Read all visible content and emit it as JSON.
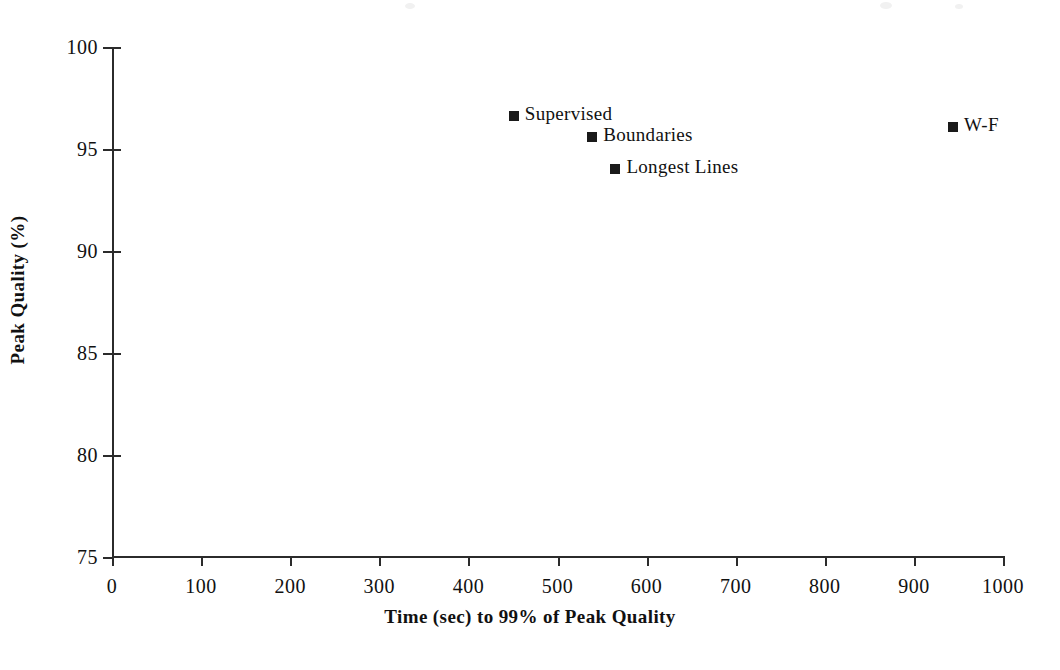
{
  "chart_data": {
    "type": "scatter",
    "title": "",
    "xlabel": "Time (sec) to 99% of Peak Quality",
    "ylabel": "Peak Quality (%)",
    "xlim": [
      0,
      1000
    ],
    "ylim": [
      75,
      100
    ],
    "xticks": [
      0,
      100,
      200,
      300,
      400,
      500,
      600,
      700,
      800,
      900,
      1000
    ],
    "xtick_labels": [
      "0",
      "100",
      "200",
      "300",
      "400",
      "500",
      "600",
      "700",
      "800",
      "900",
      "1000"
    ],
    "yticks": [
      75,
      80,
      85,
      90,
      95,
      100
    ],
    "ytick_labels": [
      "75",
      "80",
      "85",
      "90",
      "95",
      "100"
    ],
    "grid": false,
    "legend": "none",
    "marker_style": "filled-square",
    "marker_color": "#1a1a1a",
    "axis_color": "#2b2b2b",
    "background_color": "#ffffff",
    "points": [
      {
        "label": "Supervised",
        "x": 451,
        "y": 96.6
      },
      {
        "label": "Boundaries",
        "x": 539,
        "y": 95.6
      },
      {
        "label": "Longest Lines",
        "x": 565,
        "y": 94.0
      },
      {
        "label": "W-F",
        "x": 944,
        "y": 96.1
      }
    ]
  }
}
